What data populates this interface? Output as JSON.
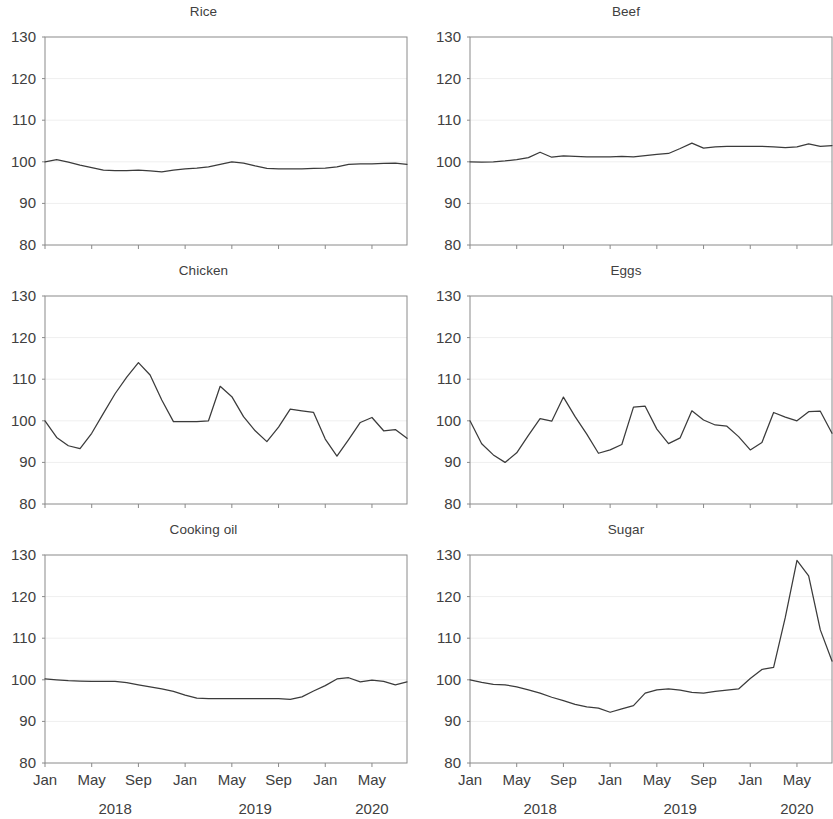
{
  "figure": {
    "background": "#ffffff",
    "line_color": "#3b3b3b",
    "grid_color": "#efefef",
    "axis_color": "#8a8a8a",
    "text_color": "#404040"
  },
  "axis": {
    "y_ticks": [
      "130",
      "120",
      "110",
      "100",
      "90",
      "80"
    ],
    "y_min": 80,
    "y_max": 130,
    "x_tick_labels": [
      "Jan",
      "May",
      "Sep",
      "Jan",
      "May",
      "Sep",
      "Jan",
      "May"
    ],
    "x_tick_indices": [
      0,
      4,
      8,
      12,
      16,
      20,
      24,
      28
    ],
    "year_labels": [
      "2018",
      "2019",
      "2020"
    ],
    "year_label_indices": [
      6,
      18,
      28
    ],
    "n_points": 32,
    "grid": "horizontal"
  },
  "chart_data": [
    {
      "type": "line",
      "title": "Rice",
      "xlabel": "",
      "ylabel": "",
      "ylim": [
        80,
        130
      ],
      "categories": [
        "Jan 2018",
        "Feb 2018",
        "Mar 2018",
        "Apr 2018",
        "May 2018",
        "Jun 2018",
        "Jul 2018",
        "Aug 2018",
        "Sep 2018",
        "Oct 2018",
        "Nov 2018",
        "Dec 2018",
        "Jan 2019",
        "Feb 2019",
        "Mar 2019",
        "Apr 2019",
        "May 2019",
        "Jun 2019",
        "Jul 2019",
        "Aug 2019",
        "Sep 2019",
        "Oct 2019",
        "Nov 2019",
        "Dec 2019",
        "Jan 2020",
        "Feb 2020",
        "Mar 2020",
        "Apr 2020",
        "May 2020",
        "Jun 2020",
        "Jul 2020",
        "Aug 2020"
      ],
      "values": [
        100.0,
        100.5,
        99.9,
        99.2,
        98.6,
        98.0,
        97.9,
        97.9,
        98.0,
        97.8,
        97.6,
        98.0,
        98.3,
        98.5,
        98.8,
        99.4,
        100.0,
        99.7,
        99.0,
        98.4,
        98.3,
        98.3,
        98.3,
        98.4,
        98.5,
        98.8,
        99.4,
        99.5,
        99.5,
        99.6,
        99.7,
        99.4
      ]
    },
    {
      "type": "line",
      "title": "Beef",
      "xlabel": "",
      "ylabel": "",
      "ylim": [
        80,
        130
      ],
      "categories": [
        "Jan 2018",
        "Feb 2018",
        "Mar 2018",
        "Apr 2018",
        "May 2018",
        "Jun 2018",
        "Jul 2018",
        "Aug 2018",
        "Sep 2018",
        "Oct 2018",
        "Nov 2018",
        "Dec 2018",
        "Jan 2019",
        "Feb 2019",
        "Mar 2019",
        "Apr 2019",
        "May 2019",
        "Jun 2019",
        "Jul 2019",
        "Aug 2019",
        "Sep 2019",
        "Oct 2019",
        "Nov 2019",
        "Dec 2019",
        "Jan 2020",
        "Feb 2020",
        "Mar 2020",
        "Apr 2020",
        "May 2020",
        "Jun 2020",
        "Jul 2020",
        "Aug 2020"
      ],
      "values": [
        100.0,
        99.9,
        100.0,
        100.2,
        100.5,
        101.0,
        102.3,
        101.1,
        101.4,
        101.3,
        101.2,
        101.2,
        101.2,
        101.3,
        101.2,
        101.5,
        101.8,
        102.0,
        103.2,
        104.5,
        103.3,
        103.6,
        103.7,
        103.7,
        103.7,
        103.7,
        103.6,
        103.4,
        103.6,
        104.3,
        103.7,
        103.9
      ]
    },
    {
      "type": "line",
      "title": "Chicken",
      "xlabel": "",
      "ylabel": "",
      "ylim": [
        80,
        130
      ],
      "categories": [
        "Jan 2018",
        "Feb 2018",
        "Mar 2018",
        "Apr 2018",
        "May 2018",
        "Jun 2018",
        "Jul 2018",
        "Aug 2018",
        "Sep 2018",
        "Oct 2018",
        "Nov 2018",
        "Dec 2018",
        "Jan 2019",
        "Feb 2019",
        "Mar 2019",
        "Apr 2019",
        "May 2019",
        "Jun 2019",
        "Jul 2019",
        "Aug 2019",
        "Sep 2019",
        "Oct 2019",
        "Nov 2019",
        "Dec 2019",
        "Jan 2020",
        "Feb 2020",
        "Mar 2020",
        "Apr 2020",
        "May 2020",
        "Jun 2020",
        "Jul 2020",
        "Aug 2020"
      ],
      "values": [
        100.0,
        96.0,
        94.0,
        93.3,
        97.0,
        101.8,
        106.5,
        110.5,
        114.0,
        111.0,
        105.0,
        99.8,
        99.8,
        99.8,
        100.0,
        108.3,
        105.8,
        101.0,
        97.6,
        95.0,
        98.5,
        102.8,
        102.4,
        102.0,
        95.6,
        91.5,
        95.5,
        99.6,
        100.8,
        97.6,
        97.9,
        95.8
      ]
    },
    {
      "type": "line",
      "title": "Eggs",
      "xlabel": "",
      "ylabel": "",
      "ylim": [
        80,
        130
      ],
      "categories": [
        "Jan 2018",
        "Feb 2018",
        "Mar 2018",
        "Apr 2018",
        "May 2018",
        "Jun 2018",
        "Jul 2018",
        "Aug 2018",
        "Sep 2018",
        "Oct 2018",
        "Nov 2018",
        "Dec 2018",
        "Jan 2019",
        "Feb 2019",
        "Mar 2019",
        "Apr 2019",
        "May 2019",
        "Jun 2019",
        "Jul 2019",
        "Aug 2019",
        "Sep 2019",
        "Oct 2019",
        "Nov 2019",
        "Dec 2019",
        "Jan 2020",
        "Feb 2020",
        "Mar 2020",
        "Apr 2020",
        "May 2020",
        "Jun 2020",
        "Jul 2020",
        "Aug 2020"
      ],
      "values": [
        100.0,
        94.5,
        91.8,
        90.0,
        92.3,
        96.5,
        100.5,
        99.9,
        105.7,
        101.0,
        96.8,
        92.2,
        93.0,
        94.3,
        103.3,
        103.5,
        98.0,
        94.5,
        95.9,
        102.4,
        100.2,
        99.0,
        98.7,
        96.2,
        93.0,
        94.8,
        102.0,
        100.9,
        100.0,
        102.2,
        102.3,
        97.0
      ]
    },
    {
      "type": "line",
      "title": "Cooking oil",
      "xlabel": "",
      "ylabel": "",
      "ylim": [
        80,
        130
      ],
      "categories": [
        "Jan 2018",
        "Feb 2018",
        "Mar 2018",
        "Apr 2018",
        "May 2018",
        "Jun 2018",
        "Jul 2018",
        "Aug 2018",
        "Sep 2018",
        "Oct 2018",
        "Nov 2018",
        "Dec 2018",
        "Jan 2019",
        "Feb 2019",
        "Mar 2019",
        "Apr 2019",
        "May 2019",
        "Jun 2019",
        "Jul 2019",
        "Aug 2019",
        "Sep 2019",
        "Oct 2019",
        "Nov 2019",
        "Dec 2019",
        "Jan 2020",
        "Feb 2020",
        "Mar 2020",
        "Apr 2020",
        "May 2020",
        "Jun 2020",
        "Jul 2020",
        "Aug 2020"
      ],
      "values": [
        100.2,
        100.0,
        99.8,
        99.7,
        99.6,
        99.6,
        99.6,
        99.3,
        98.8,
        98.3,
        97.8,
        97.2,
        96.3,
        95.6,
        95.5,
        95.5,
        95.5,
        95.5,
        95.5,
        95.5,
        95.5,
        95.3,
        95.9,
        97.3,
        98.6,
        100.2,
        100.5,
        99.5,
        99.9,
        99.6,
        98.8,
        99.5
      ]
    },
    {
      "type": "line",
      "title": "Sugar",
      "xlabel": "",
      "ylabel": "",
      "ylim": [
        80,
        130
      ],
      "categories": [
        "Jan 2018",
        "Feb 2018",
        "Mar 2018",
        "Apr 2018",
        "May 2018",
        "Jun 2018",
        "Jul 2018",
        "Aug 2018",
        "Sep 2018",
        "Oct 2018",
        "Nov 2018",
        "Dec 2018",
        "Jan 2019",
        "Feb 2019",
        "Mar 2019",
        "Apr 2019",
        "May 2019",
        "Jun 2019",
        "Jul 2019",
        "Aug 2019",
        "Sep 2019",
        "Oct 2019",
        "Nov 2019",
        "Dec 2019",
        "Jan 2020",
        "Feb 2020",
        "Mar 2020",
        "Apr 2020",
        "May 2020",
        "Jun 2020",
        "Jul 2020",
        "Aug 2020"
      ],
      "values": [
        100.0,
        99.4,
        98.9,
        98.8,
        98.3,
        97.6,
        96.8,
        95.8,
        95.0,
        94.1,
        93.5,
        93.2,
        92.2,
        93.0,
        93.8,
        96.8,
        97.6,
        97.8,
        97.5,
        97.0,
        96.8,
        97.2,
        97.5,
        97.8,
        100.3,
        102.5,
        103.0,
        115.0,
        128.7,
        125.0,
        112.0,
        104.5
      ]
    }
  ]
}
